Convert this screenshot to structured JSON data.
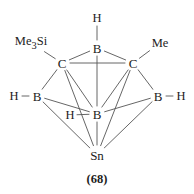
{
  "figure": {
    "caption": "(68)",
    "stroke_color": "#555555",
    "text_color": "#1c1c1c",
    "background": "#ffffff"
  },
  "atoms": [
    {
      "id": "b-apex",
      "label": "B",
      "x": 97,
      "y": 48,
      "name": "atom-boron-apex"
    },
    {
      "id": "c-left",
      "label": "C",
      "x": 62,
      "y": 63,
      "name": "atom-carbon-left"
    },
    {
      "id": "c-right",
      "label": "C",
      "x": 133,
      "y": 63,
      "name": "atom-carbon-right"
    },
    {
      "id": "b-left",
      "label": "B",
      "x": 37,
      "y": 96,
      "name": "atom-boron-left"
    },
    {
      "id": "b-right",
      "label": "B",
      "x": 158,
      "y": 96,
      "name": "atom-boron-right"
    },
    {
      "id": "b-center",
      "label": "B",
      "x": 97,
      "y": 114,
      "name": "atom-boron-center"
    },
    {
      "id": "sn",
      "label": "Sn",
      "x": 97,
      "y": 155,
      "name": "atom-tin"
    }
  ],
  "substituents": [
    {
      "id": "h-top",
      "label": "H",
      "x": 97,
      "y": 18,
      "name": "substituent-hydrogen-top"
    },
    {
      "id": "me3si",
      "label": "Me",
      "sub": "3",
      "label2": "Si",
      "x": 31,
      "y": 43,
      "name": "substituent-trimethylsilyl"
    },
    {
      "id": "me",
      "label": "Me",
      "x": 160,
      "y": 43,
      "name": "substituent-methyl"
    },
    {
      "id": "h-left",
      "label": "H",
      "x": 14,
      "y": 96,
      "name": "substituent-hydrogen-left"
    },
    {
      "id": "h-right",
      "label": "H",
      "x": 181,
      "y": 96,
      "name": "substituent-hydrogen-right"
    },
    {
      "id": "h-bridge",
      "label": "H",
      "x": 70,
      "y": 115,
      "name": "substituent-hydrogen-bridging"
    }
  ],
  "bonds": [
    {
      "from": "h-top",
      "to": "b-apex",
      "name": "bond-h-to-apex-boron"
    },
    {
      "from": "me3si",
      "to": "c-left",
      "name": "bond-me3si-to-carbon-left"
    },
    {
      "from": "me",
      "to": "c-right",
      "name": "bond-me-to-carbon-right"
    },
    {
      "from": "h-left",
      "to": "b-left",
      "name": "bond-h-to-boron-left"
    },
    {
      "from": "h-right",
      "to": "b-right",
      "name": "bond-h-to-boron-right"
    },
    {
      "from": "h-bridge",
      "to": "b-center",
      "name": "bond-bridging-h-to-boron-center"
    },
    {
      "from": "b-apex",
      "to": "c-left",
      "name": "bond-apex-boron-carbon-left"
    },
    {
      "from": "b-apex",
      "to": "c-right",
      "name": "bond-apex-boron-carbon-right"
    },
    {
      "from": "b-apex",
      "to": "b-center",
      "name": "bond-apex-boron-center-boron"
    },
    {
      "from": "c-left",
      "to": "c-right",
      "name": "bond-carbon-carbon"
    },
    {
      "from": "c-left",
      "to": "b-left",
      "name": "bond-carbon-left-boron-left"
    },
    {
      "from": "c-left",
      "to": "b-center",
      "name": "bond-carbon-left-boron-center"
    },
    {
      "from": "c-left",
      "to": "sn",
      "name": "bond-carbon-left-tin"
    },
    {
      "from": "c-right",
      "to": "b-right",
      "name": "bond-carbon-right-boron-right"
    },
    {
      "from": "c-right",
      "to": "b-center",
      "name": "bond-carbon-right-boron-center"
    },
    {
      "from": "c-right",
      "to": "sn",
      "name": "bond-carbon-right-tin"
    },
    {
      "from": "b-left",
      "to": "b-center",
      "name": "bond-boron-left-boron-center"
    },
    {
      "from": "b-left",
      "to": "sn",
      "name": "bond-boron-left-tin"
    },
    {
      "from": "b-right",
      "to": "b-center",
      "name": "bond-boron-right-boron-center"
    },
    {
      "from": "b-right",
      "to": "sn",
      "name": "bond-boron-right-tin"
    },
    {
      "from": "b-center",
      "to": "sn",
      "name": "bond-boron-center-tin"
    }
  ]
}
